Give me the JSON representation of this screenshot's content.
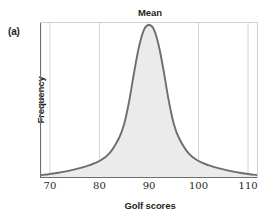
{
  "figure": {
    "panel_label": "(a)",
    "title": "Mean",
    "xlabel": "Golf scores",
    "ylabel": "Frequency"
  },
  "colors": {
    "curve_stroke": "#6d6e70",
    "curve_fill": "#ebebeb",
    "gridline": "#d4d4d4",
    "frame": "#d0d0d0",
    "axis": "#6d6e70",
    "text": "#231f20"
  },
  "chart_data": {
    "type": "area",
    "title": "Mean",
    "xlabel": "Golf scores",
    "ylabel": "Frequency",
    "xlim": [
      68,
      112
    ],
    "ylim": [
      0,
      1
    ],
    "xticks": [
      70,
      80,
      90,
      100,
      110
    ],
    "xtick_labels": [
      "70",
      "80",
      "90",
      "100",
      "110"
    ],
    "yticks": [],
    "ytick_labels": [],
    "grid": "vertical",
    "legend": "none",
    "annotations": [
      {
        "text": "Mean",
        "x": 90,
        "position": "above-axis",
        "marker": "vertical-gridline"
      },
      {
        "text": "(a)",
        "position": "outside-top-left"
      }
    ],
    "series": [
      {
        "name": "Golf score distribution",
        "kind": "density",
        "distribution": "symmetric-bell-heavy-tailed",
        "mean": 90,
        "x": [
          68,
          70,
          72,
          74,
          76,
          78,
          80,
          82,
          84,
          85,
          86,
          87,
          88,
          89,
          90,
          91,
          92,
          93,
          94,
          95,
          96,
          98,
          100,
          102,
          104,
          106,
          108,
          110,
          112
        ],
        "y": [
          0.012,
          0.02,
          0.03,
          0.042,
          0.058,
          0.078,
          0.105,
          0.155,
          0.26,
          0.35,
          0.5,
          0.69,
          0.86,
          0.97,
          1.0,
          0.97,
          0.86,
          0.69,
          0.5,
          0.35,
          0.26,
          0.155,
          0.105,
          0.078,
          0.058,
          0.042,
          0.03,
          0.02,
          0.012
        ]
      }
    ]
  }
}
